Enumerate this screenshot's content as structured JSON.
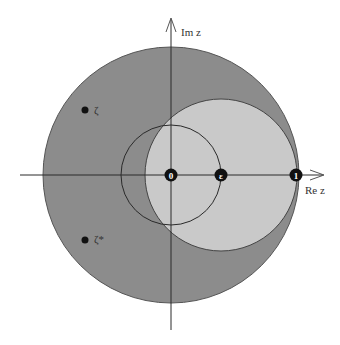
{
  "diagram": {
    "axes": {
      "real_label": "Re z",
      "imag_label": "Im z"
    },
    "points": {
      "origin": "0",
      "epsilon": "ε",
      "one": "1",
      "zeta": "ζ",
      "zeta_conj": "ζ*"
    },
    "colors": {
      "outer_disk": "#8c8c8c",
      "inner_disk": "#c9c9c9",
      "stroke": "#2a2a2a",
      "background": "#ffffff"
    }
  }
}
